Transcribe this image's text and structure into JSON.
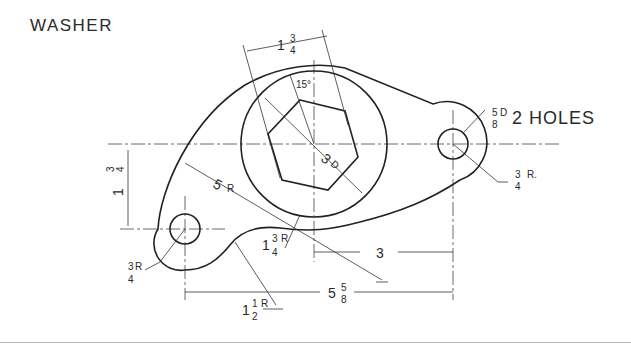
{
  "title": "WASHER",
  "note_holes": "2 HOLES",
  "dimensions": {
    "hole_dia": {
      "num": "5",
      "den": "8",
      "suffix": "D"
    },
    "right_radius": {
      "num": "3",
      "den": "4",
      "suffix": "R."
    },
    "left_radius": {
      "num": "3",
      "den": "4",
      "suffix": "R"
    },
    "large_radius": {
      "whole": "5",
      "suffix": "R"
    },
    "circle_dia": {
      "whole": "3",
      "suffix": "D"
    },
    "angle": "15°",
    "hex_width": {
      "whole": "1",
      "num": "3",
      "den": "4"
    },
    "vertical_offset": {
      "whole": "1",
      "num": "3",
      "den": "4"
    },
    "fillet_radius": {
      "whole": "1",
      "num": "3",
      "den": "4",
      "suffix": "R"
    },
    "concave_radius": {
      "whole": "1",
      "num": "1",
      "den": "2",
      "suffix": "R"
    },
    "horizontal_3": "3",
    "overall_length": {
      "whole": "5",
      "num": "5",
      "den": "8"
    }
  }
}
